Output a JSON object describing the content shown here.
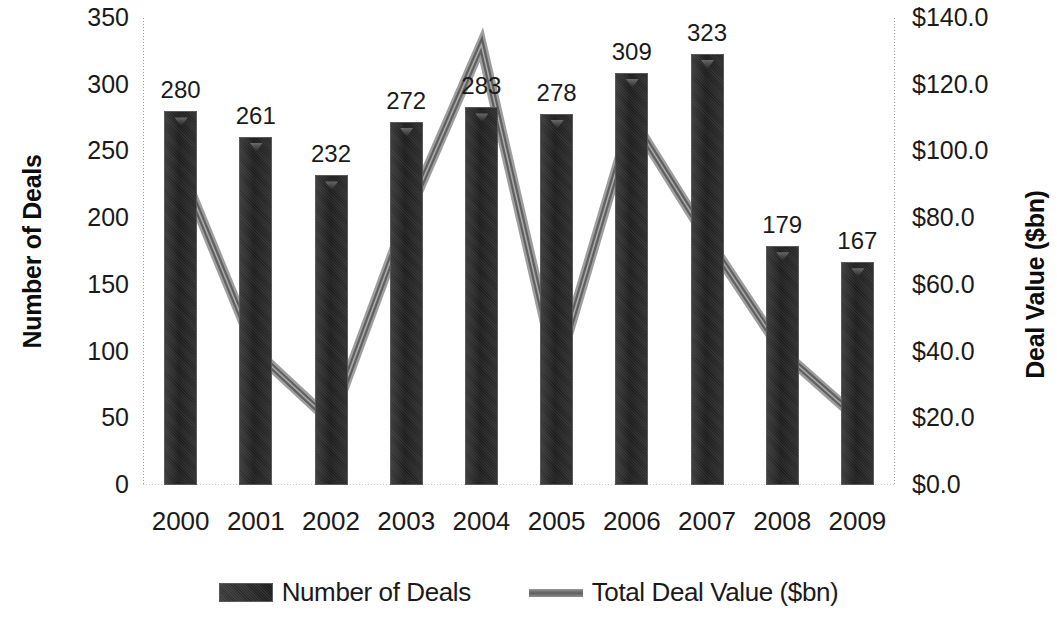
{
  "chart_data": {
    "type": "bar",
    "title": "",
    "subtitle": "",
    "categories": [
      "2000",
      "2001",
      "2002",
      "2003",
      "2004",
      "2005",
      "2006",
      "2007",
      "2008",
      "2009"
    ],
    "xlabel": "",
    "ylabel": "Number of Deals",
    "y2label": "Deal Value ($bn)",
    "ylim": [
      0,
      350
    ],
    "y2lim": [
      0,
      140
    ],
    "yticks": [
      "0",
      "50",
      "100",
      "150",
      "200",
      "250",
      "300",
      "350"
    ],
    "ytick_values": [
      0,
      50,
      100,
      150,
      200,
      250,
      300,
      350
    ],
    "y2ticks": [
      "$0.0",
      "$20.0",
      "$40.0",
      "$60.0",
      "$80.0",
      "$100.0",
      "$120.0",
      "$140.0"
    ],
    "y2tick_values": [
      0,
      20,
      40,
      60,
      80,
      100,
      120,
      140
    ],
    "grid": false,
    "legend_position": "bottom",
    "series": [
      {
        "name": "Number of Deals",
        "type": "bar",
        "axis": "left",
        "color": "#262626",
        "values": [
          280,
          261,
          232,
          272,
          283,
          278,
          309,
          323,
          179,
          167
        ],
        "data_labels": [
          "280",
          "261",
          "232",
          "272",
          "283",
          "278",
          "309",
          "323",
          "179",
          "167"
        ]
      },
      {
        "name": "Total Deal Value ($bn)",
        "type": "line",
        "axis": "right",
        "color": "#7d7d7d",
        "values": [
          95.0,
          40.0,
          19.0,
          80.0,
          132.0,
          34.0,
          110.0,
          74.0,
          40.0,
          20.0
        ]
      }
    ]
  },
  "legend": {
    "items": [
      {
        "label": "Number of Deals",
        "marker": "bar-swatch"
      },
      {
        "label": "Total Deal Value ($bn)",
        "marker": "line-swatch"
      }
    ]
  }
}
